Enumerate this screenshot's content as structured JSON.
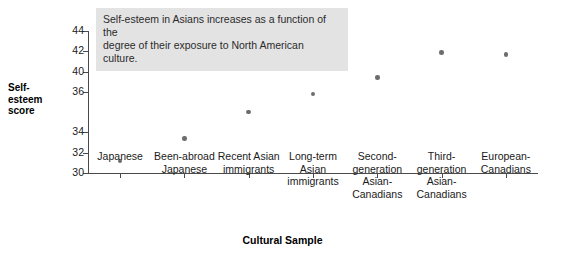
{
  "chart_data": {
    "type": "scatter",
    "title": "",
    "xlabel": "Cultural Sample",
    "ylabel": "Self-esteem score",
    "ylabel_lines": [
      "Self-",
      "esteem",
      "score"
    ],
    "categories": [
      "Japanese",
      "Been-abroad Japanese",
      "Recent Asian immigrants",
      "Long-term Asian immigrants",
      "Second-generation Asian-Canadians",
      "Third-generation Asian-Canadians",
      "European-Canadians"
    ],
    "category_lines": [
      [
        "Japanese"
      ],
      [
        "Been-abroad",
        "Japanese"
      ],
      [
        "Recent Asian",
        "immigrants"
      ],
      [
        "Long-term",
        "Asian",
        "immigrants"
      ],
      [
        "Second-",
        "generation",
        "Asian-",
        "Canadians"
      ],
      [
        "Third-",
        "generation",
        "Asian-",
        "Canadians"
      ],
      [
        "European-",
        "Canadians"
      ]
    ],
    "values": [
      31.2,
      33.4,
      36.0,
      37.8,
      39.4,
      41.9,
      41.7
    ],
    "ylim": [
      30,
      44
    ],
    "ytick_values": [
      44,
      42,
      40,
      38,
      36,
      34,
      32,
      30
    ],
    "ytick_labels": [
      "44",
      "42",
      "40",
      "36",
      "34",
      "32",
      "30"
    ],
    "ytick_label_positions": [
      44,
      42,
      40,
      38,
      34,
      32,
      30
    ],
    "grid": false,
    "legend": "none",
    "point_color": "#6d6d6d",
    "axis_color": "#4a4a4a"
  },
  "annotation": {
    "lines": [
      "Self-esteem in Asians increases as a function of the",
      "degree of their exposure to North American culture."
    ],
    "background_color": "#e3e3e3"
  }
}
